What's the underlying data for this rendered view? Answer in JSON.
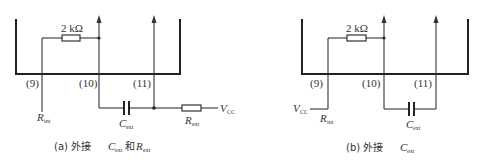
{
  "diagram_a": {
    "resistor_value": "2 kΩ",
    "pins": [
      "(9)",
      "(10)",
      "(11)"
    ],
    "rint_label": "R",
    "rint_sub": "int",
    "cext_label": "C",
    "cext_sub": "ext",
    "rext_label": "R",
    "rext_sub": "ext",
    "vcc_label": "V",
    "vcc_sub": "CC",
    "caption_prefix": "(a) 外接",
    "caption_c": "C",
    "caption_c_sub": "ext",
    "caption_and": "和",
    "caption_r": "R",
    "caption_r_sub": "ext"
  },
  "diagram_b": {
    "resistor_value": "2 kΩ",
    "pins": [
      "(9)",
      "(10)",
      "(11)"
    ],
    "vcc_label": "V",
    "vcc_sub": "CC",
    "rint_label": "R",
    "rint_sub": "int",
    "cext_label": "C",
    "cext_sub": "ext",
    "caption_prefix": "(b) 外接",
    "caption_c": "C",
    "caption_c_sub": "ext"
  },
  "colors": {
    "line": "#333333",
    "background": "#ffffff"
  }
}
